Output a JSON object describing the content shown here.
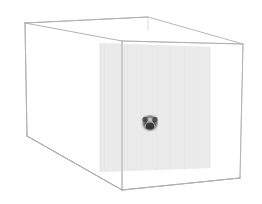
{
  "scene": {
    "title": "3D Volume Slice Visualization",
    "background_color": "#ffffff",
    "canvas": {
      "width": 262,
      "height": 204
    }
  },
  "wireframe_box": {
    "name": "bounding-box",
    "description": "Perspective wireframe cuboid",
    "edge_color": "#b4b4b4",
    "edge_width": 0.8,
    "vertices": {
      "front_top_left": {
        "x": 25,
        "y": 23
      },
      "front_top_right": {
        "x": 122,
        "y": 41
      },
      "front_bottom_left": {
        "x": 27,
        "y": 136
      },
      "front_bottom_right": {
        "x": 122,
        "y": 190
      },
      "back_top_left": {
        "x": 122,
        "y": 41
      },
      "back_top_right": {
        "x": 243,
        "y": 44
      },
      "back_bottom_left": {
        "x": 122,
        "y": 190
      },
      "back_bottom_right": {
        "x": 240,
        "y": 178
      }
    }
  },
  "slice_plane": {
    "name": "slice-plane",
    "description": "Semi-transparent gray cross-section plane inside the box",
    "fill_color": "#e8e8e8",
    "opacity": 0.55,
    "corners": {
      "top_left": {
        "x": 100,
        "y": 43
      },
      "top_right": {
        "x": 210,
        "y": 47
      },
      "bottom_right": {
        "x": 210,
        "y": 168
      },
      "bottom_left": {
        "x": 100,
        "y": 172
      }
    }
  },
  "blob": {
    "name": "dark-blob-marker",
    "description": "Small dark grayscale object rendered on the slice plane",
    "center": {
      "x": 150,
      "y": 123
    },
    "width": 17,
    "height": 17,
    "core_color": "#3a3a3a",
    "mid_color": "#6e6e6e",
    "edge_color": "#a8a8a8",
    "highlight_color": "#d2d2d2"
  },
  "legend": {
    "visible": false,
    "entries": []
  },
  "axes": {
    "visible": false,
    "x_label": "",
    "y_label": "",
    "z_label": ""
  },
  "annotations": []
}
